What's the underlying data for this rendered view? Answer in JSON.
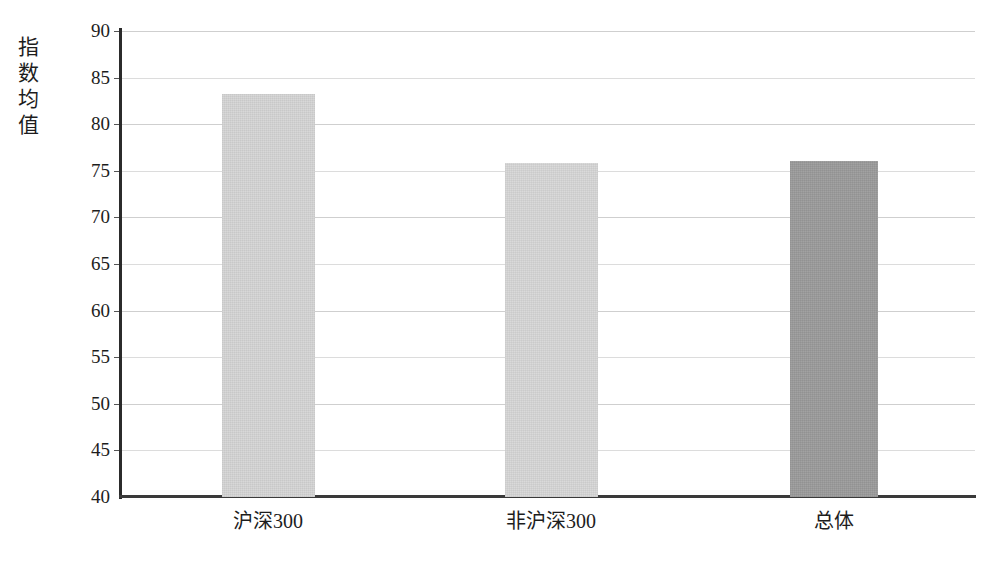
{
  "chart_data": {
    "type": "bar",
    "title": "",
    "subtitle": "",
    "xlabel": "",
    "ylabel": "指数均值",
    "ylabel_chars": [
      "指",
      "数",
      "均",
      "值"
    ],
    "categories": [
      "沪深300",
      "非沪深300",
      "总体"
    ],
    "values": [
      83.2,
      75.8,
      76.1
    ],
    "series": [
      {
        "name": "指数均值",
        "values": [
          83.2,
          75.8,
          76.1
        ]
      }
    ],
    "ylim": [
      40,
      90
    ],
    "ytick_step": 5,
    "yticks": [
      90,
      85,
      80,
      75,
      70,
      65,
      60,
      55,
      50,
      45,
      40
    ],
    "ytick_labels": [
      "90",
      "85",
      "80",
      "75",
      "70",
      "65",
      "60",
      "55",
      "50",
      "45",
      "40"
    ],
    "grid": true,
    "grid_axis": "y",
    "legend": false,
    "legend_position": "none",
    "bar_colors": [
      "#d6d6d6",
      "#d8d8d8",
      "#9c9c9c"
    ],
    "axis_color": "#2b2b2b",
    "grid_color": "#cfcfcf",
    "background_color": "#ffffff",
    "text_color": "#1d1d1d",
    "annotations": []
  }
}
